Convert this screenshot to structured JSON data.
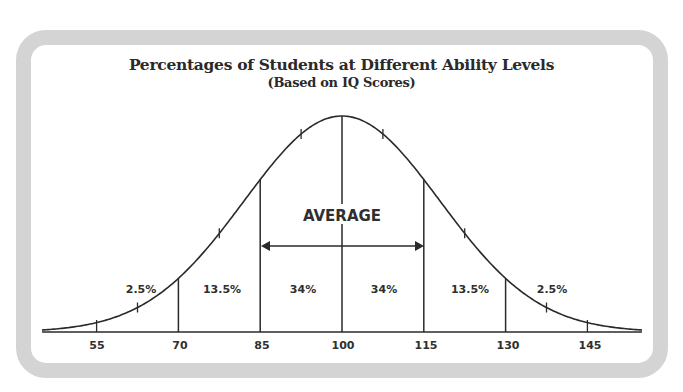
{
  "frame": {
    "border_color": "#d4d4d4",
    "line_color": "#2a2a2a"
  },
  "chart_data": {
    "type": "area",
    "title": "Percentages of Students at Different Ability Levels",
    "subtitle": "(Based on IQ Scores)",
    "xlabel": "",
    "ylabel": "",
    "distribution": "normal",
    "mean": 100,
    "sd": 15,
    "x_ticks": [
      55,
      70,
      85,
      100,
      115,
      130,
      145
    ],
    "x_tick_labels": [
      "55",
      "70",
      "85",
      "100",
      "115",
      "130",
      "145"
    ],
    "dividers": [
      70,
      85,
      100,
      115,
      130
    ],
    "segments": [
      {
        "range": "<70",
        "percent": "2.5%"
      },
      {
        "range": "70-85",
        "percent": "13.5%"
      },
      {
        "range": "85-100",
        "percent": "34%"
      },
      {
        "range": "100-115",
        "percent": "34%"
      },
      {
        "range": "115-130",
        "percent": "13.5%"
      },
      {
        "range": ">130",
        "percent": "2.5%"
      }
    ],
    "annotations": [
      {
        "text": "AVERAGE",
        "span": [
          85,
          115
        ],
        "type": "double-arrow"
      }
    ],
    "grid": false,
    "legend": "none"
  }
}
